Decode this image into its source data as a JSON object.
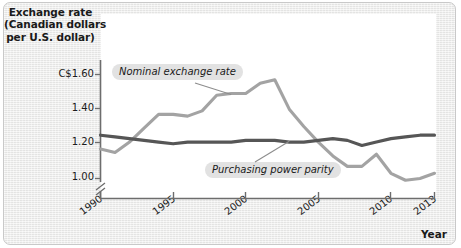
{
  "chart_data": {
    "type": "line",
    "title": "",
    "ylabel": "Exchange rate (Canadian dollars per U.S. dollar)",
    "ylabel_lines": [
      "Exchange rate",
      "(Canadian dollars",
      "per U.S. dollar)"
    ],
    "xlabel": "Year",
    "grid": false,
    "legend_position": "inline-callouts",
    "yticks": [
      "C$1.60",
      "1.40",
      "1.20",
      "1.00"
    ],
    "ytick_values": [
      1.6,
      1.4,
      1.2,
      1.0
    ],
    "ylim": [
      0.95,
      1.68
    ],
    "y_axis_break": true,
    "xticks": [
      "1990",
      "1995",
      "2000",
      "2005",
      "2010",
      "2013"
    ],
    "xtick_values": [
      1990,
      1995,
      2000,
      2005,
      2010,
      2013
    ],
    "xlim": [
      1990,
      2013
    ],
    "x": [
      1990,
      1991,
      1992,
      1993,
      1994,
      1995,
      1996,
      1997,
      1998,
      1999,
      2000,
      2001,
      2002,
      2003,
      2004,
      2005,
      2006,
      2007,
      2008,
      2009,
      2010,
      2011,
      2012,
      2013
    ],
    "series": [
      {
        "name": "Nominal exchange rate",
        "color": "#a3a3a3",
        "values": [
          1.17,
          1.15,
          1.21,
          1.29,
          1.37,
          1.37,
          1.36,
          1.39,
          1.48,
          1.49,
          1.49,
          1.55,
          1.57,
          1.4,
          1.3,
          1.21,
          1.13,
          1.07,
          1.07,
          1.14,
          1.03,
          0.99,
          1.0,
          1.03
        ]
      },
      {
        "name": "Purchasing power parity",
        "color": "#565656",
        "values": [
          1.25,
          1.24,
          1.23,
          1.22,
          1.21,
          1.2,
          1.21,
          1.21,
          1.21,
          1.21,
          1.22,
          1.22,
          1.22,
          1.21,
          1.21,
          1.22,
          1.23,
          1.22,
          1.19,
          1.21,
          1.23,
          1.24,
          1.25,
          1.25
        ]
      }
    ],
    "annotations": [
      {
        "text": "Nominal exchange rate",
        "target_x": 1999,
        "target_y": 1.485
      },
      {
        "text": "Purchasing power parity",
        "target_x": 2003,
        "target_y": 1.215
      }
    ]
  },
  "axis": {
    "y_title_line1": "Exchange rate",
    "y_title_line2": "(Canadian dollars",
    "y_title_line3": "per U.S. dollar)",
    "x_title": "Year",
    "ytick0": "C$1.60",
    "ytick1": "1.40",
    "ytick2": "1.20",
    "ytick3": "1.00",
    "xtick0": "1990",
    "xtick1": "1995",
    "xtick2": "2000",
    "xtick3": "2005",
    "xtick4": "2010",
    "xtick5": "2013"
  },
  "callouts": {
    "nominal": "Nominal exchange rate",
    "ppp": "Purchasing power parity"
  },
  "colors": {
    "nominal_line": "#a3a3a3",
    "ppp_line": "#565656",
    "axis": "#6d6d6d",
    "panel_bg": "#ececeb",
    "plot_bg": "#ffffff",
    "callout_bg": "#e2e2e2",
    "text": "#1a1a1a"
  }
}
